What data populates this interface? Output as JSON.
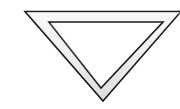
{
  "canvas": {
    "width": 180,
    "height": 109,
    "background_color": "#ffffff"
  },
  "figure": {
    "name": "downward-pointing-triangle-outline",
    "orientation": "point-down",
    "clipped_edges": "right",
    "stroke_color": "#1a1a1a",
    "band_fill_color": "#ededed",
    "interior_fill_color": "#ffffff",
    "outer_stroke_width": 1.6,
    "inner_stroke_width": 1.6,
    "outer_triangle": {
      "vertices": [
        {
          "label": "top-left",
          "x": 25,
          "y": 11.5
        },
        {
          "label": "top-right",
          "x": 181,
          "y": 11.5
        },
        {
          "label": "bottom",
          "x": 103,
          "y": 101
        }
      ]
    },
    "inner_triangle": {
      "vertices": [
        {
          "label": "top-left",
          "x": 49,
          "y": 22
        },
        {
          "label": "top-right",
          "x": 163,
          "y": 22
        },
        {
          "label": "bottom",
          "x": 101,
          "y": 88
        }
      ]
    },
    "shading": {
      "highlight_color": "#f7f7f7",
      "shadow_color": "#c9c9c9",
      "gradient_direction": "top-light-to-bottom-dark"
    }
  }
}
